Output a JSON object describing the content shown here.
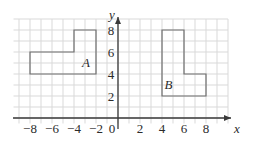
{
  "chart_data": {
    "type": "scatter",
    "title": "",
    "xlabel": "x",
    "ylabel": "y",
    "xlim": [
      -9,
      9
    ],
    "ylim": [
      -1,
      9
    ],
    "grid": true,
    "grid_step": 1,
    "legend": "none",
    "x_ticks": [
      "-8",
      "-6",
      "-4",
      "-2",
      "0",
      "2",
      "4",
      "6",
      "8"
    ],
    "x_tick_values": [
      -8,
      -6,
      -4,
      -2,
      0,
      2,
      4,
      6,
      8
    ],
    "y_ticks": [
      "2",
      "4",
      "6",
      "8"
    ],
    "y_tick_values": [
      2,
      4,
      6,
      8
    ],
    "origin_label": "0",
    "shapes": [
      {
        "label": "A",
        "label_position": [
          -2.9,
          4.6
        ],
        "kind": "L-shaped polygon",
        "vertices": [
          [
            -8,
            4
          ],
          [
            -8,
            6
          ],
          [
            -4,
            6
          ],
          [
            -4,
            8
          ],
          [
            -2,
            8
          ],
          [
            -2,
            4
          ]
        ]
      },
      {
        "label": "B",
        "label_position": [
          4.6,
          2.6
        ],
        "kind": "L-shaped polygon",
        "vertices": [
          [
            4,
            2
          ],
          [
            4,
            8
          ],
          [
            6,
            8
          ],
          [
            6,
            4
          ],
          [
            8,
            4
          ],
          [
            8,
            2
          ]
        ]
      }
    ],
    "colors": {
      "background": "#ffffff",
      "grid": "#d9d9d9",
      "axis": "#3a3a3a",
      "shape_stroke": "#6f6f6f",
      "text": "#2b2b2b"
    }
  },
  "axes": {
    "x_axis_name": "x",
    "y_axis_name": "y"
  }
}
